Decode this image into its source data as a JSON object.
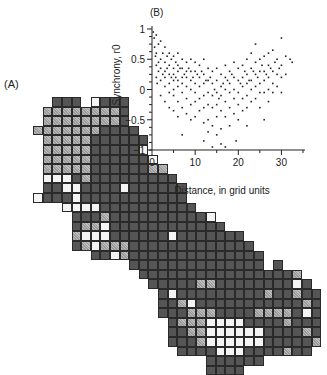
{
  "panel_a": {
    "label": "(A)",
    "description": "Grid map of cells shaded by value",
    "cell_size_px": 9.6,
    "legend_codes": {
      "D": "dark",
      "G": "gray hatched",
      "W": "white",
      ".": "empty"
    },
    "rows": [
      "....DDD.WDDD....................",
      "...GGGGGGGGD....................",
      "...GGGGGGGGD....................",
      "..GGGGGGGDDDD...................",
      "...GGGGGDDDDDD..................",
      "...GGGGGDDDDDW..................",
      "...GGGGGDDDDDDW.................",
      "...GGGGGDDDDDDGG................",
      "...WWWDGDDDDDDDDD...............",
      "...DDWWDDDDWDDDDDD..............",
      "..WDDDWDDDDDDDDDDD..............",
      ".....WWWWDDDDDDDDDD.............",
      "......DDDGDDDDDDDDDDW...........",
      "......DGGWDDDDDDDDDDDD..........",
      "......GWWWDDDDDDWDDDDDDD........",
      "......DGWGGGDDDDDDDDDDDDD.......",
      "........DDWGDDDDDDDDDDDDDD......",
      "............DDDDDDDDDDDDDD.D....",
      ".............DDDDDDDDDDDDDDDDG..",
      "..............DDDDDGGDDDDDDDDWD.",
      "...............DWDDDDDDDDDGDDGDD",
      "...............DDGWDDDDDDDDDDDGD",
      "...............DDDGGGDDDDGGGGDWD",
      "................DGGGWWWWDDDDGDDD",
      "................DDGGWWWWWWDDDDGD",
      "................DDDGWWWWWWDDDDDG",
      ".................DDDDWWWDDDDGDD.",
      "....................DDDDDD......",
      "....................DDDD........"
    ]
  },
  "chart_data": {
    "type": "scatter",
    "panel_label": "(B)",
    "title": "",
    "xlabel": "Distance, in grid units",
    "ylabel": "Synchrony, r0",
    "xlim": [
      0,
      35
    ],
    "ylim": [
      -1,
      1
    ],
    "xticks": [
      0,
      10,
      20,
      30
    ],
    "yticks": [
      1,
      0.5,
      0,
      -0.5,
      -1
    ],
    "ytick_labels": [
      "1",
      "0.5",
      "0",
      "−0.5",
      "−1"
    ],
    "grid": false,
    "legend": null,
    "trend_description": "Dense cloud; synchrony near 0.2-0.6 at short distances, declining to about 0 around 10-20 units with spread down to about -0.9 near 13-17 units, then slight rise to about 0.2-0.4 at 25-32 units",
    "series": [
      {
        "name": "pairs",
        "points": [
          [
            0.3,
            0.95
          ],
          [
            0.5,
            0.85
          ],
          [
            0.6,
            0.7
          ],
          [
            0.8,
            0.55
          ],
          [
            1,
            0.9
          ],
          [
            1,
            0.6
          ],
          [
            1,
            0.4
          ],
          [
            1,
            0.2
          ],
          [
            1.2,
            0.1
          ],
          [
            1.5,
            0.75
          ],
          [
            1.5,
            0.45
          ],
          [
            1.5,
            0.3
          ],
          [
            2,
            0.8
          ],
          [
            2,
            0.5
          ],
          [
            2,
            0.35
          ],
          [
            2,
            0.15
          ],
          [
            2,
            -0.1
          ],
          [
            2.5,
            0.6
          ],
          [
            2.5,
            0.25
          ],
          [
            3,
            0.7
          ],
          [
            3,
            0.45
          ],
          [
            3,
            0.3
          ],
          [
            3,
            0.2
          ],
          [
            3,
            0.05
          ],
          [
            3,
            -0.2
          ],
          [
            3.5,
            0.55
          ],
          [
            3.5,
            0.35
          ],
          [
            4,
            0.6
          ],
          [
            4,
            0.4
          ],
          [
            4,
            0.25
          ],
          [
            4,
            0.1
          ],
          [
            4,
            -0.05
          ],
          [
            4,
            -0.3
          ],
          [
            4.5,
            0.5
          ],
          [
            4.5,
            0.2
          ],
          [
            5,
            0.55
          ],
          [
            5,
            0.35
          ],
          [
            5,
            0.25
          ],
          [
            5,
            0.15
          ],
          [
            5,
            0.0
          ],
          [
            5,
            -0.1
          ],
          [
            5,
            -0.35
          ],
          [
            5.5,
            0.45
          ],
          [
            5.5,
            0.2
          ],
          [
            6,
            0.6
          ],
          [
            6,
            0.4
          ],
          [
            6,
            0.3
          ],
          [
            6,
            0.15
          ],
          [
            6,
            0.05
          ],
          [
            6,
            -0.2
          ],
          [
            6,
            -0.45
          ],
          [
            6.5,
            0.35
          ],
          [
            7,
            0.5
          ],
          [
            7,
            0.35
          ],
          [
            7,
            0.2
          ],
          [
            7,
            0.1
          ],
          [
            7,
            -0.05
          ],
          [
            7,
            -0.3
          ],
          [
            7,
            -0.75
          ],
          [
            7.5,
            0.25
          ],
          [
            8,
            0.45
          ],
          [
            8,
            0.3
          ],
          [
            8,
            0.2
          ],
          [
            8,
            0.05
          ],
          [
            8,
            -0.15
          ],
          [
            8,
            -0.4
          ],
          [
            8.5,
            0.35
          ],
          [
            9,
            0.5
          ],
          [
            9,
            0.3
          ],
          [
            9,
            0.15
          ],
          [
            9,
            0.0
          ],
          [
            9,
            -0.25
          ],
          [
            9,
            -0.5
          ],
          [
            9.5,
            0.2
          ],
          [
            10,
            0.45
          ],
          [
            10,
            0.3
          ],
          [
            10,
            0.1
          ],
          [
            10,
            -0.05
          ],
          [
            10,
            -0.2
          ],
          [
            10,
            -0.45
          ],
          [
            10.5,
            0.25
          ],
          [
            11,
            0.4
          ],
          [
            11,
            0.2
          ],
          [
            11,
            0.05
          ],
          [
            11,
            -0.15
          ],
          [
            11,
            -0.35
          ],
          [
            11.5,
            0.3
          ],
          [
            12,
            0.5
          ],
          [
            12,
            0.25
          ],
          [
            12,
            0.1
          ],
          [
            12,
            -0.1
          ],
          [
            12,
            -0.3
          ],
          [
            12,
            -0.55
          ],
          [
            12,
            -0.85
          ],
          [
            12.5,
            0.15
          ],
          [
            13,
            0.35
          ],
          [
            13,
            0.15
          ],
          [
            13,
            -0.05
          ],
          [
            13,
            -0.25
          ],
          [
            13,
            -0.5
          ],
          [
            13,
            -0.7
          ],
          [
            13.5,
            0.2
          ],
          [
            14,
            0.3
          ],
          [
            14,
            0.1
          ],
          [
            14,
            -0.1
          ],
          [
            14,
            -0.3
          ],
          [
            14,
            -0.6
          ],
          [
            14,
            -0.95
          ],
          [
            14.5,
            0.0
          ],
          [
            15,
            0.35
          ],
          [
            15,
            0.15
          ],
          [
            15,
            -0.05
          ],
          [
            15,
            -0.25
          ],
          [
            15,
            -0.45
          ],
          [
            15,
            -0.75
          ],
          [
            15.5,
            -0.15
          ],
          [
            16,
            0.25
          ],
          [
            16,
            0.05
          ],
          [
            16,
            -0.1
          ],
          [
            16,
            -0.35
          ],
          [
            16,
            -0.65
          ],
          [
            16,
            -0.9
          ],
          [
            16.5,
            0.1
          ],
          [
            17,
            0.4
          ],
          [
            17,
            0.2
          ],
          [
            17,
            0.0
          ],
          [
            17,
            -0.2
          ],
          [
            17,
            -0.45
          ],
          [
            17,
            -0.95
          ],
          [
            17.5,
            0.15
          ],
          [
            18,
            0.3
          ],
          [
            18,
            0.1
          ],
          [
            18,
            -0.05
          ],
          [
            18,
            -0.3
          ],
          [
            18,
            -0.6
          ],
          [
            18.5,
            0.25
          ],
          [
            19,
            0.45
          ],
          [
            19,
            0.2
          ],
          [
            19,
            0.0
          ],
          [
            19,
            -0.15
          ],
          [
            19,
            -0.4
          ],
          [
            19.5,
            -0.85
          ],
          [
            20,
            0.35
          ],
          [
            20,
            0.15
          ],
          [
            20,
            -0.05
          ],
          [
            20,
            -0.25
          ],
          [
            20,
            -0.5
          ],
          [
            20.5,
            0.1
          ],
          [
            21,
            0.4
          ],
          [
            21,
            0.2
          ],
          [
            21,
            0.05
          ],
          [
            21,
            -0.15
          ],
          [
            21,
            -0.35
          ],
          [
            21.5,
            0.3
          ],
          [
            22,
            0.5
          ],
          [
            22,
            0.25
          ],
          [
            22,
            0.1
          ],
          [
            22,
            -0.1
          ],
          [
            22,
            -0.3
          ],
          [
            22,
            -0.6
          ],
          [
            22.5,
            0.15
          ],
          [
            23,
            0.6
          ],
          [
            23,
            0.35
          ],
          [
            23,
            0.15
          ],
          [
            23,
            0.0
          ],
          [
            23,
            -0.2
          ],
          [
            23.5,
            0.3
          ],
          [
            24,
            0.75
          ],
          [
            24,
            0.45
          ],
          [
            24,
            0.25
          ],
          [
            24,
            0.05
          ],
          [
            24,
            -0.15
          ],
          [
            24.5,
            0.2
          ],
          [
            25,
            0.5
          ],
          [
            25,
            0.3
          ],
          [
            25,
            0.1
          ],
          [
            25,
            -0.05
          ],
          [
            25,
            -0.3
          ],
          [
            25.5,
            0.4
          ],
          [
            26,
            0.55
          ],
          [
            26,
            0.3
          ],
          [
            26,
            0.15
          ],
          [
            26,
            -0.05
          ],
          [
            26,
            -0.5
          ],
          [
            26.5,
            0.25
          ],
          [
            27,
            0.6
          ],
          [
            27,
            0.4
          ],
          [
            27,
            0.2
          ],
          [
            27,
            0.0
          ],
          [
            27,
            -0.2
          ],
          [
            27.5,
            0.35
          ],
          [
            28,
            0.65
          ],
          [
            28,
            0.3
          ],
          [
            28,
            0.1
          ],
          [
            28,
            -0.05
          ],
          [
            28.5,
            0.45
          ],
          [
            29,
            0.5
          ],
          [
            29,
            0.25
          ],
          [
            29,
            0.05
          ],
          [
            29.5,
            0.35
          ],
          [
            30,
            0.85
          ],
          [
            30,
            0.4
          ],
          [
            30,
            0.2
          ],
          [
            30,
            -0.05
          ],
          [
            31,
            0.55
          ],
          [
            31,
            0.25
          ],
          [
            32,
            0.5
          ],
          [
            32.5,
            0.45
          ]
        ]
      }
    ]
  }
}
